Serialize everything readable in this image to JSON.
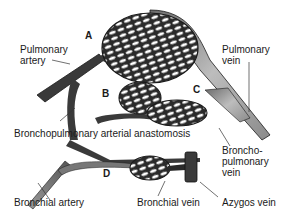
{
  "figure": {
    "type": "anatomical-diagram",
    "letters": [
      "A",
      "B",
      "C",
      "D"
    ],
    "labels": {
      "pulmonary_artery_1": "Pulmonary",
      "pulmonary_artery_2": "artery",
      "pulmonary_vein_1": "Pulmonary",
      "pulmonary_vein_2": "vein",
      "bronchopulmonary_anastomosis": "Bronchopulmonary arterial anastomosis",
      "bronchopulmonary_vein_1": "Broncho-",
      "bronchopulmonary_vein_2": "pulmonary",
      "bronchopulmonary_vein_3": "vein",
      "bronchial_artery": "Bronchial artery",
      "bronchial_vein": "Bronchial vein",
      "azygos_vein": "Azygos vein"
    },
    "colors": {
      "artery": "#3a3a3a",
      "vein": "#9a9a9a",
      "outline": "#1a1a1a",
      "background": "#ffffff"
    }
  }
}
